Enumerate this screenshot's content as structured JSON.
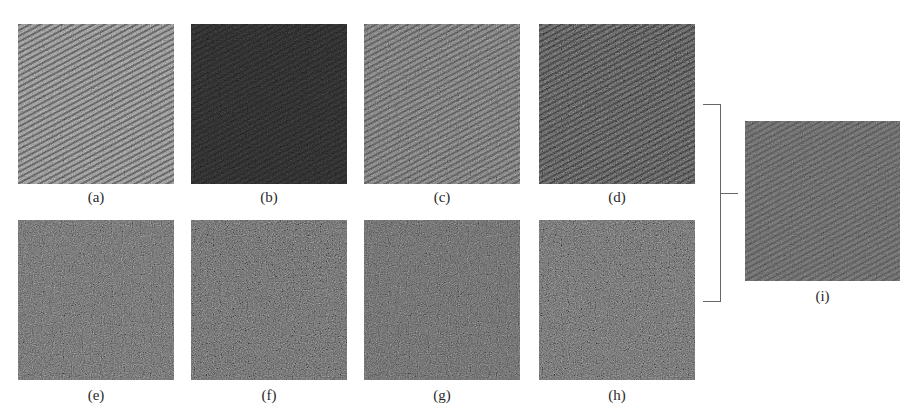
{
  "figure": {
    "panels": [
      {
        "id": "a",
        "label": "(a)",
        "tone": "light",
        "striped": true
      },
      {
        "id": "b",
        "label": "(b)",
        "tone": "dark",
        "striped": true
      },
      {
        "id": "c",
        "label": "(c)",
        "tone": "medium",
        "striped": true
      },
      {
        "id": "d",
        "label": "(d)",
        "tone": "medium-dark",
        "striped": true
      },
      {
        "id": "e",
        "label": "(e)",
        "tone": "medium",
        "striped": false
      },
      {
        "id": "f",
        "label": "(f)",
        "tone": "medium",
        "striped": false
      },
      {
        "id": "g",
        "label": "(g)",
        "tone": "medium",
        "striped": false
      },
      {
        "id": "h",
        "label": "(h)",
        "tone": "medium",
        "striped": false
      },
      {
        "id": "i",
        "label": "(i)",
        "tone": "medium",
        "striped": true
      }
    ]
  }
}
